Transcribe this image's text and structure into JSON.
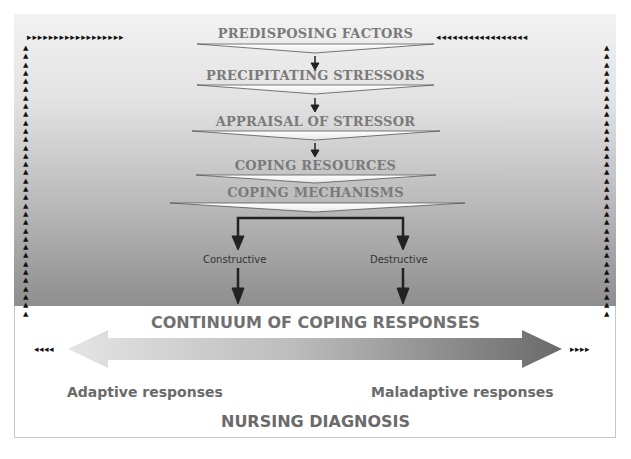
{
  "diagram": {
    "steps": [
      {
        "label": "PREDISPOSING FACTORS"
      },
      {
        "label": "PRECIPITATING STRESSORS"
      },
      {
        "label": "APPRAISAL OF STRESSOR"
      },
      {
        "label": "COPING RESOURCES"
      },
      {
        "label": "COPING MECHANISMS"
      }
    ],
    "branches": {
      "left": "Constructive",
      "right": "Destructive"
    },
    "continuum": {
      "title": "CONTINUUM OF COPING RESPONSES",
      "left_label": "Adaptive responses",
      "right_label": "Maladaptive responses"
    },
    "outcome": "NURSING DIAGNOSIS",
    "feedback_arrows": {
      "top_left": "▸▸▸▸▸▸▸▸▸▸▸▸▸▸▸▸▸▸",
      "top_right": "◂◂◂◂◂◂◂◂◂◂◂◂◂◂◂◂◂",
      "bottom_left": "◂◂◂◂",
      "bottom_right": "▸▸▸▸"
    },
    "colors": {
      "text_gray": "#7a7a7a",
      "arrow_dark": "#222222",
      "continuum_light": "#e0e0e0",
      "continuum_dark": "#6e6e6e"
    }
  }
}
